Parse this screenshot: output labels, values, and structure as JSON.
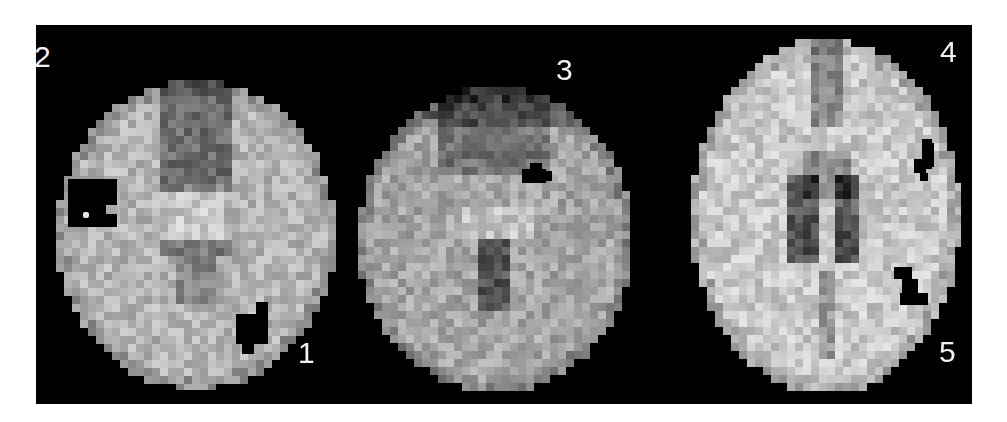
{
  "figure": {
    "background_color": "#000000",
    "page_background": "#ffffff",
    "slices": [
      {
        "id": "slice-left",
        "x": 20,
        "y": 55,
        "w": 280,
        "h": 310,
        "seed": 11,
        "labels": [
          {
            "text": "2",
            "x": -2,
            "y": 17
          },
          {
            "text": "1",
            "x": 262,
            "y": 313
          }
        ]
      },
      {
        "id": "slice-middle",
        "x": 322,
        "y": 62,
        "w": 276,
        "h": 305,
        "seed": 23,
        "labels": [
          {
            "text": "3",
            "x": 520,
            "y": 30
          }
        ]
      },
      {
        "id": "slice-right",
        "x": 655,
        "y": 14,
        "w": 270,
        "h": 355,
        "seed": 37,
        "labels": [
          {
            "text": "4",
            "x": 904,
            "y": 12
          },
          {
            "text": "5",
            "x": 903,
            "y": 312
          }
        ]
      }
    ],
    "lesions": [
      {
        "region": "2",
        "rects": [
          [
            32,
            154,
            49,
            48
          ],
          [
            32,
            154,
            30,
            48
          ]
        ],
        "notch": [
          70,
          180,
          11,
          9
        ]
      },
      {
        "region": "1",
        "rects": [
          [
            200,
            289,
            24,
            30
          ],
          [
            220,
            277,
            12,
            42
          ],
          [
            206,
            319,
            12,
            10
          ]
        ]
      },
      {
        "region": "3",
        "rects": [
          [
            486,
            144,
            24,
            14
          ],
          [
            494,
            138,
            12,
            8
          ],
          [
            506,
            146,
            10,
            10
          ]
        ]
      },
      {
        "region": "4",
        "rects": [
          [
            886,
            114,
            10,
            30
          ],
          [
            878,
            134,
            12,
            14
          ],
          [
            884,
            148,
            8,
            8
          ],
          [
            892,
            118,
            6,
            24
          ]
        ]
      },
      {
        "region": "5",
        "rects": [
          [
            858,
            242,
            18,
            12
          ],
          [
            866,
            254,
            16,
            14
          ],
          [
            864,
            268,
            28,
            12
          ]
        ]
      }
    ],
    "white_dot": {
      "x": 47,
      "y": 187,
      "w": 6,
      "h": 6
    }
  }
}
